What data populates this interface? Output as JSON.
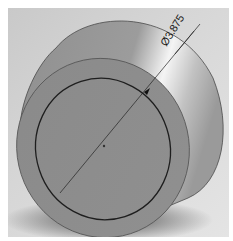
{
  "viewport": {
    "model": "cylinder",
    "background_color": "#d4d4d4",
    "body_color": "#9a9a9a",
    "face_color": "#8c8c8c",
    "highlight_color": "#f2f2f2"
  },
  "dimension": {
    "symbol": "Ø",
    "value": "3.875",
    "label": "Ø3.875"
  }
}
